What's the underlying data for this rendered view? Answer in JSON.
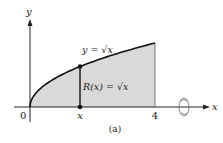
{
  "diagram": {
    "caption": "(a)",
    "axis_labels": {
      "x": "x",
      "y": "y"
    },
    "tick_labels": {
      "origin": "0",
      "point": "x",
      "end": "4"
    },
    "curve_label": "y = √x",
    "radius_label": "R(x) = √x",
    "function": "sqrt",
    "domain": [
      0,
      4
    ],
    "sample_x_fraction": 0.4,
    "colors": {
      "fill": "#d9d9d9",
      "stroke": "#111111"
    },
    "rotation_icon": "rotation-arrow-icon"
  }
}
